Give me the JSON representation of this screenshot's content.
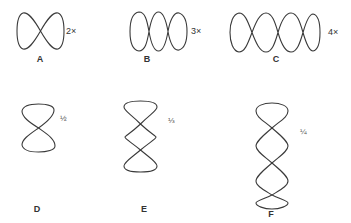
{
  "figures": [
    {
      "id": "A",
      "label": "A",
      "annotation": "2×",
      "orientation": "horizontal",
      "loops": 2
    },
    {
      "id": "B",
      "label": "B",
      "annotation": "3×",
      "orientation": "horizontal",
      "loops": 3
    },
    {
      "id": "C",
      "label": "C",
      "annotation": "4×",
      "orientation": "horizontal",
      "loops": 4
    },
    {
      "id": "D",
      "label": "D",
      "annotation": "½",
      "orientation": "vertical",
      "loops": 2
    },
    {
      "id": "E",
      "label": "E",
      "annotation": "⅓",
      "orientation": "vertical",
      "loops": 3
    },
    {
      "id": "F",
      "label": "F",
      "annotation": "¼",
      "orientation": "vertical",
      "loops": 4
    }
  ],
  "colors": {
    "stroke": "#3a3a3a",
    "background": "#ffffff"
  }
}
